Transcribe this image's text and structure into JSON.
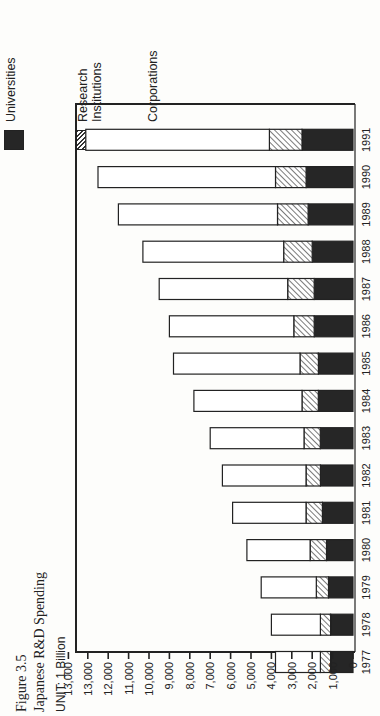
{
  "figure": {
    "number": "Figure 3.5",
    "title": "Japanese R&D Spending",
    "unit": "UNIT:  1 Billion"
  },
  "legend": [
    {
      "key": "universities",
      "label": "Universities",
      "color": "#262626",
      "pattern": "solid"
    },
    {
      "key": "research",
      "label": "Research Institutions",
      "label_lines": [
        "Research",
        "Institutions"
      ],
      "color": "#333333",
      "pattern": "diagonal-hatch"
    },
    {
      "key": "corporations",
      "label": "Corporations",
      "color": "#ffffff",
      "pattern": "outline"
    }
  ],
  "chart_data": {
    "type": "bar",
    "orientation": "vertical stacked bars (page rotated 90° counter-clockwise)",
    "stacked": true,
    "title": "Japanese R&D Spending",
    "subtitle": "Figure 3.5",
    "xlabel": "",
    "ylabel": "UNIT: 1 Billion",
    "categories": [
      "1977",
      "1978",
      "1979",
      "1980",
      "1981",
      "1982",
      "1983",
      "1984",
      "1985",
      "1986",
      "1987",
      "1988",
      "1989",
      "1990",
      "1991"
    ],
    "series": [
      {
        "name": "Universities",
        "values": [
          1.1,
          1.1,
          1.2,
          1.3,
          1.5,
          1.6,
          1.6,
          1.7,
          1.7,
          1.9,
          1.9,
          2.0,
          2.2,
          2.3,
          2.5
        ]
      },
      {
        "name": "Research Institutions",
        "values": [
          0.5,
          0.5,
          0.6,
          0.8,
          0.8,
          0.7,
          0.8,
          0.8,
          0.9,
          1.0,
          1.3,
          1.4,
          1.5,
          1.5,
          1.6
        ]
      },
      {
        "name": "Corporations",
        "values": [
          2.2,
          2.4,
          2.7,
          3.1,
          3.6,
          4.1,
          4.6,
          5.3,
          6.2,
          6.1,
          6.3,
          6.9,
          7.8,
          8.7,
          9.0
        ]
      }
    ],
    "totals": [
      3.8,
      4.0,
      4.5,
      5.2,
      5.9,
      6.4,
      7.0,
      7.8,
      8.8,
      9.0,
      9.5,
      10.3,
      11.5,
      12.5,
      13.1
    ],
    "value_units": "thousands of billions (axis labels in billions)",
    "yticks": [
      "0",
      "1,000",
      "2,000",
      "3,000",
      "4,000",
      "5,000",
      "6,000",
      "7,000",
      "8,000",
      "9,000",
      "10,000",
      "11,000",
      "12,000",
      "13,000",
      "13,000"
    ],
    "ylim": [
      0,
      14000
    ],
    "grid": false,
    "legend_position": "top-right (above plot when rotated)"
  }
}
